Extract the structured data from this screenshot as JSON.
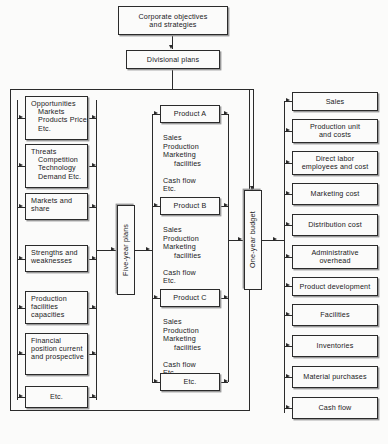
{
  "diagram": {
    "top": {
      "corporate": "Corporate objectives\nand strategies",
      "divisional": "Divisional plans"
    },
    "left_column": {
      "items": [
        {
          "head": "Opportunities",
          "sub": "Markets\nProducts\nPrice\nEtc."
        },
        {
          "head": "Threats",
          "sub": "Competition\nTechnology\nDemand\nEtc."
        },
        {
          "head": "Markets and\nshare",
          "sub": ""
        },
        {
          "head": "Strengths and\nweaknesses",
          "sub": ""
        },
        {
          "head": "Production\nfacilities\ncapacities",
          "sub": ""
        },
        {
          "head": "Financial\nposition\ncurrent and\nprospective",
          "sub": ""
        },
        {
          "head": "Etc.",
          "sub": ""
        }
      ]
    },
    "five_year": {
      "label": "Five-year plans"
    },
    "products": {
      "items": [
        {
          "label": "Product A",
          "detail_1": "Sales\nProduction\nMarketing",
          "detail_2": "facilities",
          "detail_3": "Cash flow\nEtc."
        },
        {
          "label": "Product B",
          "detail_1": "Sales\nProduction\nMarketing",
          "detail_2": "facilities",
          "detail_3": "Cash flow\nEtc."
        },
        {
          "label": "Product C",
          "detail_1": "Sales\nProduction\nMarketing",
          "detail_2": "facilities",
          "detail_3": "Cash flow\nEtc."
        },
        {
          "label": "Etc.",
          "detail_1": "",
          "detail_2": "",
          "detail_3": ""
        }
      ]
    },
    "one_year": {
      "label": "One-year budget"
    },
    "right_column": {
      "items": [
        {
          "label": "Sales"
        },
        {
          "label": "Production unit\nand costs"
        },
        {
          "label": "Direct labor\nemployees and cost"
        },
        {
          "label": "Marketing cost"
        },
        {
          "label": "Distribution cost"
        },
        {
          "label": "Administrative\noverhead"
        },
        {
          "label": "Product development"
        },
        {
          "label": "Facilities"
        },
        {
          "label": "Inventories"
        },
        {
          "label": "Material purchases"
        },
        {
          "label": "Cash flow"
        }
      ]
    },
    "colors": {
      "ink": "#2b2b2b",
      "paper": "#fbfbfa",
      "shadow": "#9a9a9a"
    }
  }
}
